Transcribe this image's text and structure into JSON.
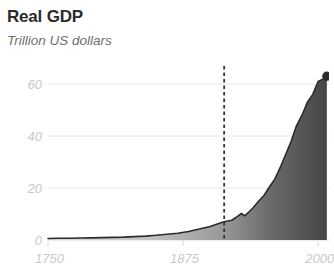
{
  "chart_data": {
    "type": "area",
    "title": "Real GDP",
    "subtitle": "Trillion US dollars",
    "xlabel": "",
    "ylabel": "Trillion US dollars",
    "xlim": [
      1750,
      2010
    ],
    "ylim": [
      0,
      68
    ],
    "grid": true,
    "legend": false,
    "xticks": [
      1750,
      1875,
      2000
    ],
    "xtick_labels": [
      "1750",
      "1875",
      "2000"
    ],
    "yticks": [
      0,
      20,
      40,
      60
    ],
    "ytick_labels": [
      "0",
      "20",
      "40",
      "60"
    ],
    "annotations": [
      {
        "name": "dashed-vertical-marker",
        "type": "vline",
        "x": 1913,
        "style": "dashed",
        "color": "#333333"
      },
      {
        "name": "endpoint-dot",
        "type": "point",
        "x": 2008,
        "y": 63,
        "color": "#2b2b2b"
      }
    ],
    "series": [
      {
        "name": "Real GDP",
        "x": [
          1750,
          1760,
          1770,
          1780,
          1790,
          1800,
          1810,
          1820,
          1830,
          1840,
          1850,
          1860,
          1870,
          1880,
          1890,
          1900,
          1910,
          1913,
          1920,
          1925,
          1929,
          1932,
          1935,
          1940,
          1945,
          1950,
          1955,
          1960,
          1965,
          1970,
          1975,
          1980,
          1985,
          1990,
          1995,
          2000,
          2005,
          2008
        ],
        "values": [
          0.6,
          0.65,
          0.7,
          0.75,
          0.8,
          0.9,
          1.0,
          1.1,
          1.3,
          1.5,
          1.8,
          2.2,
          2.6,
          3.3,
          4.2,
          5.2,
          6.6,
          7.0,
          7.6,
          9.0,
          10.2,
          9.3,
          10.4,
          12.5,
          15.0,
          17.2,
          20.5,
          23.5,
          28.0,
          33.0,
          38.0,
          44.0,
          48.0,
          53.0,
          56.0,
          61.0,
          62.0,
          63.0
        ]
      }
    ],
    "colors": {
      "line": "#2b2b2b",
      "fill_left": "#d9d9d9",
      "fill_right": "#474747",
      "gridline": "#e6e6e6",
      "tick_text": "#c9c9c9",
      "title_text": "#2b2b2b",
      "subtitle_text": "#6e6e6e"
    }
  }
}
